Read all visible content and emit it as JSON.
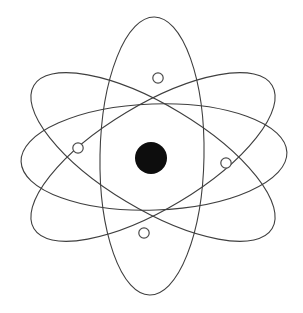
{
  "figure": {
    "width": 303,
    "height": 313,
    "background_color": "#ffffff"
  },
  "style": {
    "orbit_stroke_color": "#3f3f3f",
    "orbit_stroke_width": 1.1,
    "orbit_fill": "none",
    "nucleus_color": "#0d0d0d",
    "electron_fill_color": "#ffffff",
    "electron_stroke_color": "#4a4a4a",
    "electron_stroke_width": 1.2
  },
  "center": {
    "cx": 153,
    "cy": 157
  },
  "nucleus": {
    "label": "nucleus",
    "cx": 151,
    "cy": 158,
    "r": 16,
    "color": "#0d0d0d"
  },
  "orbits": [
    {
      "id": "orbit-horizontal",
      "label": "Horizontal orbit",
      "cx": 154,
      "cy": 157,
      "rx": 133,
      "ry": 53,
      "rotation": -2
    },
    {
      "id": "orbit-vertical",
      "label": "Vertical orbit",
      "cx": 152,
      "cy": 156,
      "rx": 52,
      "ry": 139,
      "rotation": 1
    },
    {
      "id": "orbit-diagonal-left",
      "label": "Diagonal orbit tilted left",
      "cx": 153,
      "cy": 157,
      "rx": 52,
      "ry": 139,
      "rotation": 59
    },
    {
      "id": "orbit-diagonal-right",
      "label": "Diagonal orbit tilted right",
      "cx": 153,
      "cy": 157,
      "rx": 52,
      "ry": 139,
      "rotation": -59
    }
  ],
  "electrons": [
    {
      "id": "electron-top",
      "label": "Electron 1",
      "cx": 158,
      "cy": 78,
      "r": 5.2
    },
    {
      "id": "electron-left",
      "label": "Electron 2",
      "cx": 78,
      "cy": 148,
      "r": 5.2
    },
    {
      "id": "electron-right",
      "label": "Electron 3",
      "cx": 226,
      "cy": 163,
      "r": 5.2
    },
    {
      "id": "electron-bottom",
      "label": "Electron 4",
      "cx": 144,
      "cy": 233,
      "r": 5.2
    }
  ],
  "counts": {
    "orbit_count": 4,
    "electron_count": 4,
    "nucleus_count": 1
  }
}
